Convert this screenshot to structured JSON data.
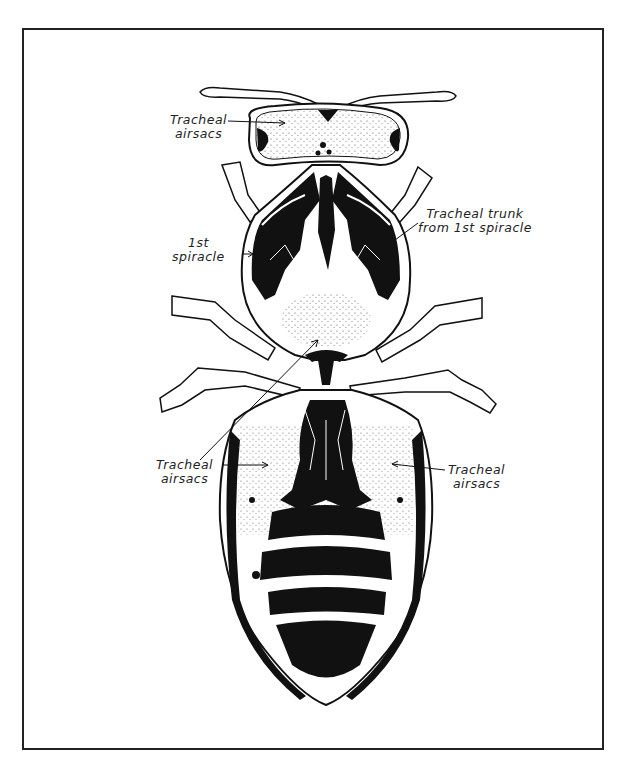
{
  "figure": {
    "labels": {
      "head_airsacs": "Tracheal\nairsacs",
      "tracheal_trunk": "Tracheal trunk\nfrom 1st spiracle",
      "first_spiracle": "1st\nspiracle",
      "left_airsacs": "Tracheal\nairsacs",
      "right_airsacs": "Tracheal\nairsacs"
    },
    "colors": {
      "ink": "#111111",
      "paper": "#ffffff",
      "frame": "#222222"
    }
  }
}
